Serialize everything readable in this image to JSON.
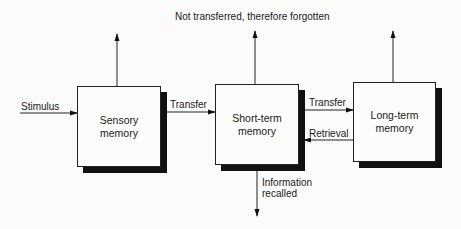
{
  "diagram": {
    "title_label": "Not transferred, therefore forgotten",
    "input_label": "Stimulus",
    "boxes": [
      {
        "id": "sensory",
        "line1": "Sensory",
        "line2": "memory"
      },
      {
        "id": "short-term",
        "line1": "Short-term",
        "line2": "memory"
      },
      {
        "id": "long-term",
        "line1": "Long-term",
        "line2": "memory"
      }
    ],
    "edges": {
      "sensory_to_short": "Transfer",
      "short_to_long": "Transfer",
      "long_to_short": "Retrieval",
      "output_line1": "Information",
      "output_line2": "recalled"
    }
  }
}
